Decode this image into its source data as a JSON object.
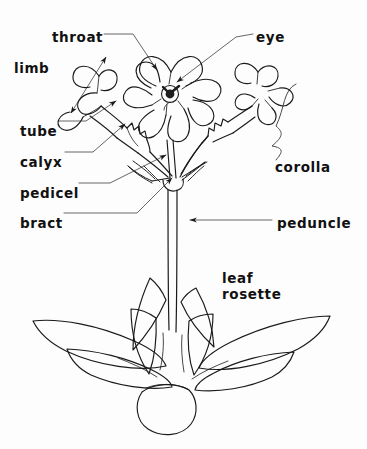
{
  "figure": {
    "background_color": "#fdfdfd",
    "ink_color": "#1a1a1a",
    "leader_color": "#4a4a4a"
  },
  "labels": [
    {
      "key": "throat",
      "text": "throat",
      "x": 52,
      "y": 30,
      "align": "left"
    },
    {
      "key": "eye",
      "text": "eye",
      "x": 256,
      "y": 30,
      "align": "left"
    },
    {
      "key": "limb",
      "text": "limb",
      "x": 14,
      "y": 61,
      "align": "left"
    },
    {
      "key": "tube",
      "text": "tube",
      "x": 20,
      "y": 124,
      "align": "left"
    },
    {
      "key": "calyx",
      "text": "calyx",
      "x": 20,
      "y": 155,
      "align": "left"
    },
    {
      "key": "pedicel",
      "text": "pedicel",
      "x": 20,
      "y": 186,
      "align": "left"
    },
    {
      "key": "bract",
      "text": "bract",
      "x": 20,
      "y": 216,
      "align": "left"
    },
    {
      "key": "corolla",
      "text": "corolla",
      "x": 275,
      "y": 160,
      "align": "left"
    },
    {
      "key": "peduncle",
      "text": "peduncle",
      "x": 277,
      "y": 216,
      "align": "left"
    },
    {
      "key": "leaf-rosette",
      "text": "leaf\nrosette",
      "x": 222,
      "y": 270,
      "align": "left"
    }
  ],
  "plant_parts": {
    "flower_center": "face-on corolla with five notched petals and dark eye",
    "flower_left": "side-view corolla showing limb, tube and calyx",
    "flower_right": "angled corolla on pedicel",
    "umbel_node": "point where pedicels and bracts join the peduncle",
    "peduncle": "main flowering stem",
    "rosette": "basal rosette of eight lance-shaped leaves"
  },
  "annotations": {
    "limb_measure": "double-headed arrow spanning the corolla limb",
    "corolla_brace": "curly brace grouping the corolla",
    "leader_lines": 9,
    "arrowheads": 9
  }
}
